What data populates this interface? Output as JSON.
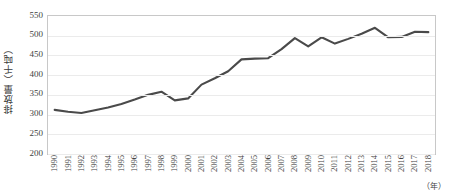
{
  "chart_data": {
    "type": "line",
    "title": "",
    "xlabel": "（年）",
    "ylabel": "排放量（千吨）",
    "ylim": [
      200,
      550
    ],
    "ytick_labels": [
      "550",
      "500",
      "450",
      "400",
      "350",
      "300",
      "250",
      "200"
    ],
    "yticks": [
      550,
      500,
      450,
      400,
      350,
      300,
      250,
      200
    ],
    "grid": true,
    "legend": "none",
    "line_color": "#4a4a4a",
    "categories": [
      "1990",
      "1991",
      "1992",
      "1993",
      "1994",
      "1995",
      "1996",
      "1997",
      "1998",
      "1999",
      "2000",
      "2001",
      "2002",
      "2003",
      "2004",
      "2005",
      "2006",
      "2007",
      "2008",
      "2009",
      "2010",
      "2011",
      "2012",
      "2013",
      "2014",
      "2015",
      "2016",
      "2017",
      "2018"
    ],
    "values": [
      312,
      307,
      304,
      311,
      318,
      327,
      338,
      350,
      358,
      336,
      341,
      376,
      392,
      410,
      440,
      442,
      443,
      466,
      494,
      473,
      496,
      480,
      492,
      505,
      520,
      496,
      497,
      510,
      509
    ],
    "series": [
      {
        "name": "排放量",
        "values": [
          312,
          307,
          304,
          311,
          318,
          327,
          338,
          350,
          358,
          336,
          341,
          376,
          392,
          410,
          440,
          442,
          443,
          466,
          494,
          473,
          496,
          480,
          492,
          505,
          520,
          496,
          497,
          510,
          509
        ]
      }
    ]
  },
  "axis": {
    "y_title": "排放量（千吨）",
    "x_unit": "（年）"
  }
}
